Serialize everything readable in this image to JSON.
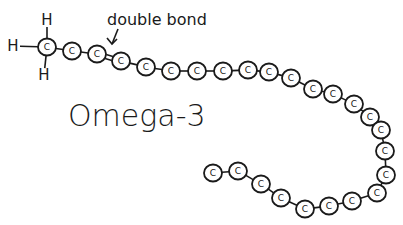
{
  "diagram": {
    "title": "Omega-3",
    "annotation": {
      "text": "double bond",
      "arrow_target": [
        112,
        44
      ]
    },
    "hydrogens": [
      {
        "label": "H",
        "x": 47,
        "y": 20
      },
      {
        "label": "H",
        "x": 13,
        "y": 46
      },
      {
        "label": "H",
        "x": 44,
        "y": 75
      }
    ],
    "carbon_label": "C",
    "carbons": [
      [
        47,
        47
      ],
      [
        72,
        51
      ],
      [
        97,
        54
      ],
      [
        121,
        61
      ],
      [
        146,
        67
      ],
      [
        171,
        71
      ],
      [
        197,
        71
      ],
      [
        223,
        71
      ],
      [
        248,
        70
      ],
      [
        269,
        72
      ],
      [
        291,
        78
      ],
      [
        313,
        89
      ],
      [
        333,
        94
      ],
      [
        354,
        104
      ],
      [
        370,
        117
      ],
      [
        381,
        130
      ],
      [
        385,
        151
      ],
      [
        386,
        175
      ],
      [
        377,
        193
      ],
      [
        352,
        201
      ],
      [
        329,
        206
      ],
      [
        305,
        209
      ],
      [
        281,
        198
      ],
      [
        261,
        184
      ],
      [
        238,
        171
      ],
      [
        213,
        173
      ]
    ],
    "double_bond_between": [
      2,
      3
    ],
    "colors": {
      "ink": "#1a1a1a",
      "background": "#ffffff"
    }
  }
}
